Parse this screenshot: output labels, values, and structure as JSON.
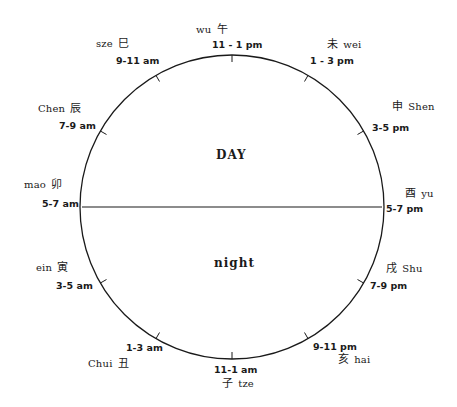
{
  "diagram": {
    "circle": {
      "cx": 232,
      "cy": 207,
      "r": 152,
      "stroke": "#1a1a1a"
    },
    "center_line": {
      "x1": 80,
      "x2": 384,
      "y": 207
    },
    "halves": {
      "day": "DAY",
      "night": "night"
    },
    "hours": [
      {
        "name": "wu",
        "hanzi": "午",
        "time": "11 - 1 pm"
      },
      {
        "name": "wei",
        "hanzi": "未",
        "time": "1 - 3 pm"
      },
      {
        "name": "Shen",
        "hanzi": "申",
        "time": "3-5 pm"
      },
      {
        "name": "yu",
        "hanzi": "酉",
        "time": "5-7 pm"
      },
      {
        "name": "Shu",
        "hanzi": "戌",
        "time": "7-9 pm"
      },
      {
        "name": "hai",
        "hanzi": "亥",
        "time": "9-11 pm"
      },
      {
        "name": "tze",
        "hanzi": "子",
        "time": "11-1 am"
      },
      {
        "name": "Chui",
        "hanzi": "丑",
        "time": "1-3 am"
      },
      {
        "name": "ein",
        "hanzi": "寅",
        "time": "3-5 am"
      },
      {
        "name": "mao",
        "hanzi": "卯",
        "time": "5-7 am"
      },
      {
        "name": "Chen",
        "hanzi": "辰",
        "time": "7-9 am"
      },
      {
        "name": "sze",
        "hanzi": "巳",
        "time": "9-11 am"
      }
    ]
  }
}
